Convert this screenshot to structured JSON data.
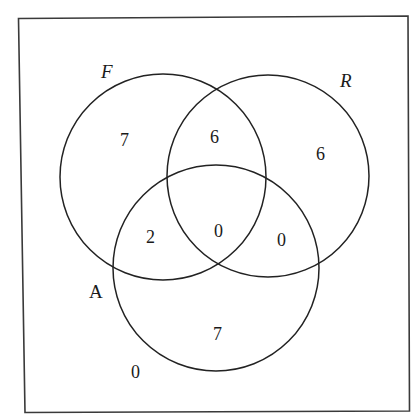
{
  "diagram": {
    "type": "venn",
    "universe": {
      "x1": 18,
      "y1": 18,
      "x2": 409,
      "y2": 411
    },
    "sets": [
      {
        "id": "F",
        "label": "F",
        "italic": true,
        "cx": 163,
        "cy": 177,
        "r": 103,
        "label_x": 101,
        "label_y": 78
      },
      {
        "id": "R",
        "label": "R",
        "italic": true,
        "cx": 268,
        "cy": 176,
        "r": 101,
        "label_x": 341,
        "label_y": 87
      },
      {
        "id": "A",
        "label": "A",
        "italic": false,
        "cx": 216,
        "cy": 268,
        "r": 103,
        "label_x": 89,
        "label_y": 298
      }
    ],
    "regions": [
      {
        "name": "F-only",
        "value": "7",
        "x": 125,
        "y": 146
      },
      {
        "name": "F-and-R-only",
        "value": "6",
        "x": 215,
        "y": 143
      },
      {
        "name": "R-only",
        "value": "6",
        "x": 321,
        "y": 160
      },
      {
        "name": "F-and-A-only",
        "value": "2",
        "x": 151,
        "y": 243
      },
      {
        "name": "F-R-A",
        "value": "0",
        "x": 219,
        "y": 237
      },
      {
        "name": "R-and-A-only",
        "value": "0",
        "x": 282,
        "y": 246
      },
      {
        "name": "A-only",
        "value": "7",
        "x": 218,
        "y": 340
      },
      {
        "name": "outside-all",
        "value": "0",
        "x": 136,
        "y": 378
      }
    ]
  },
  "labels": {
    "set_f": "F",
    "set_r": "R",
    "set_a": "A"
  },
  "counts": {
    "f_only": "7",
    "f_r_only": "6",
    "r_only": "6",
    "f_a_only": "2",
    "f_r_a": "0",
    "r_a_only": "0",
    "a_only": "7",
    "outside": "0"
  },
  "colors": {
    "line": "#222222",
    "box": "#3a3a3a",
    "text": "#1a1a1a",
    "background": "#ffffff"
  }
}
